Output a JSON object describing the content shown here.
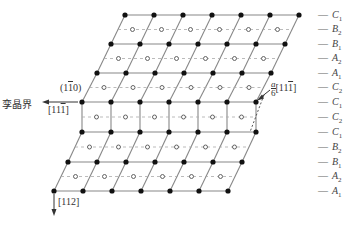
{
  "diagram": {
    "title": "",
    "labels": {
      "twin_boundary": "孪晶界",
      "plane": "(1",
      "plane_bar": "1",
      "plane_end": "0)",
      "direction_left": "[11",
      "direction_left_bar": "1",
      "direction_left_end": "]",
      "partial_num": "a",
      "partial_den": "6",
      "partial_dir": "[11",
      "partial_dir_bar": "1",
      "partial_dir_end": "]",
      "direction_down": "[112]"
    },
    "layers": [
      {
        "letter": "C",
        "sub": "1"
      },
      {
        "letter": "B",
        "sub": "2"
      },
      {
        "letter": "B",
        "sub": "1"
      },
      {
        "letter": "A",
        "sub": "2"
      },
      {
        "letter": "A",
        "sub": "1"
      },
      {
        "letter": "C",
        "sub": "2"
      },
      {
        "letter": "C",
        "sub": "1"
      },
      {
        "letter": "C",
        "sub": "2"
      },
      {
        "letter": "C",
        "sub": "1"
      },
      {
        "letter": "B",
        "sub": "2"
      },
      {
        "letter": "B",
        "sub": "1"
      },
      {
        "letter": "A",
        "sub": "2"
      },
      {
        "letter": "A",
        "sub": "1"
      }
    ],
    "colors": {
      "line": "#888888",
      "dot": "#111111",
      "dash": "#aaaaaa"
    }
  }
}
